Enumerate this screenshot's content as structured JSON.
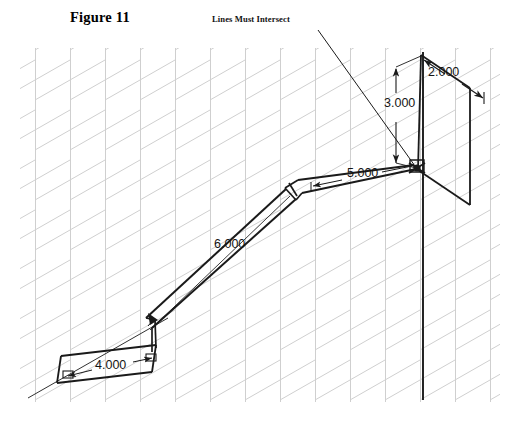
{
  "figure": {
    "title": "Figure 11",
    "note": "Lines Must Intersect"
  },
  "dimensions": {
    "d_3000": "3.000",
    "d_2000": "2.000",
    "d_5000": "5.000",
    "d_6000": "6.000",
    "d_4000": "4.000"
  },
  "colors": {
    "grid": "#cfcfcf",
    "geometry": "#1a1a1a",
    "dimension": "#2b2b2b",
    "background": "#ffffff",
    "text": "#000000"
  },
  "drawing": {
    "type": "isometric-sweep-path",
    "grid": {
      "visible": true,
      "x_min": 20,
      "x_max": 500,
      "y_min": 48,
      "y_max": 402,
      "vertical_spacing": 35,
      "diagonal_spacing": 50,
      "diagonal_angle_deg": 30
    },
    "vertical_axis_line": {
      "x": 423,
      "y_top": 52,
      "y_bottom": 400
    },
    "intersection_node": {
      "x": 417,
      "y": 168,
      "label": "Lines Must Intersect"
    },
    "leader_line": {
      "x1": 318,
      "y1": 30,
      "x2": 415,
      "y2": 166
    },
    "path_segments": [
      {
        "name": "segment-4000",
        "length": "4.000"
      },
      {
        "name": "segment-6000",
        "length": "6.000"
      },
      {
        "name": "segment-5000",
        "length": "5.000"
      },
      {
        "name": "segment-3000",
        "length": "3.000"
      },
      {
        "name": "segment-2000",
        "length": "2.000"
      }
    ]
  }
}
